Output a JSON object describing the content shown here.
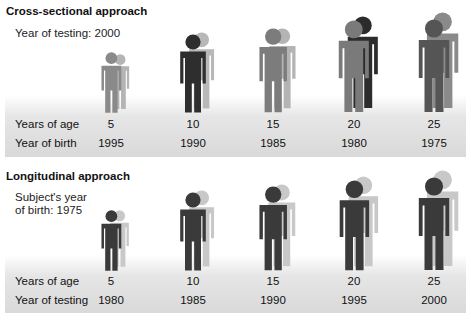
{
  "cross_sectional": {
    "title": "Cross-sectional approach",
    "subtitle": "Year of testing: 2000",
    "row1_label": "Years of age",
    "row2_label": "Year of birth",
    "groups": [
      {
        "age": "5",
        "year": "1995",
        "front_color": "#8a8a8a",
        "back_color": "#b4b4b4",
        "front_height": 62,
        "back_height": 56
      },
      {
        "age": "10",
        "year": "1990",
        "front_color": "#2e2e2e",
        "back_color": "#b8b8b8",
        "front_height": 80,
        "back_height": 78
      },
      {
        "age": "15",
        "year": "1985",
        "front_color": "#7c7c7c",
        "back_color": "#b4b4b4",
        "front_height": 86,
        "back_height": 82
      },
      {
        "age": "20",
        "year": "1980",
        "front_color": "#7a7a7a",
        "back_color": "#2c2c2c",
        "front_height": 94,
        "back_height": 94
      },
      {
        "age": "25",
        "year": "1975",
        "front_color": "#555555",
        "back_color": "#8a8a8a",
        "front_height": 95,
        "back_height": 98
      }
    ]
  },
  "longitudinal": {
    "title": "Longitudinal approach",
    "subtitle_line1": "Subject's year",
    "subtitle_line2": "of birth: 1975",
    "row1_label": "Years of age",
    "row2_label": "Year of testing",
    "groups": [
      {
        "age": "5",
        "year": "1980",
        "front_color": "#3a3a3a",
        "back_color": "#c8c8c8",
        "front_height": 62,
        "back_height": 58
      },
      {
        "age": "10",
        "year": "1985",
        "front_color": "#3a3a3a",
        "back_color": "#c8c8c8",
        "front_height": 80,
        "back_height": 78
      },
      {
        "age": "15",
        "year": "1990",
        "front_color": "#3a3a3a",
        "back_color": "#c8c8c8",
        "front_height": 86,
        "back_height": 84
      },
      {
        "age": "20",
        "year": "1995",
        "front_color": "#3a3a3a",
        "back_color": "#c8c8c8",
        "front_height": 92,
        "back_height": 92
      },
      {
        "age": "25",
        "year": "2000",
        "front_color": "#3a3a3a",
        "back_color": "#c8c8c8",
        "front_height": 95,
        "back_height": 98
      }
    ]
  },
  "caption_partial": ""
}
